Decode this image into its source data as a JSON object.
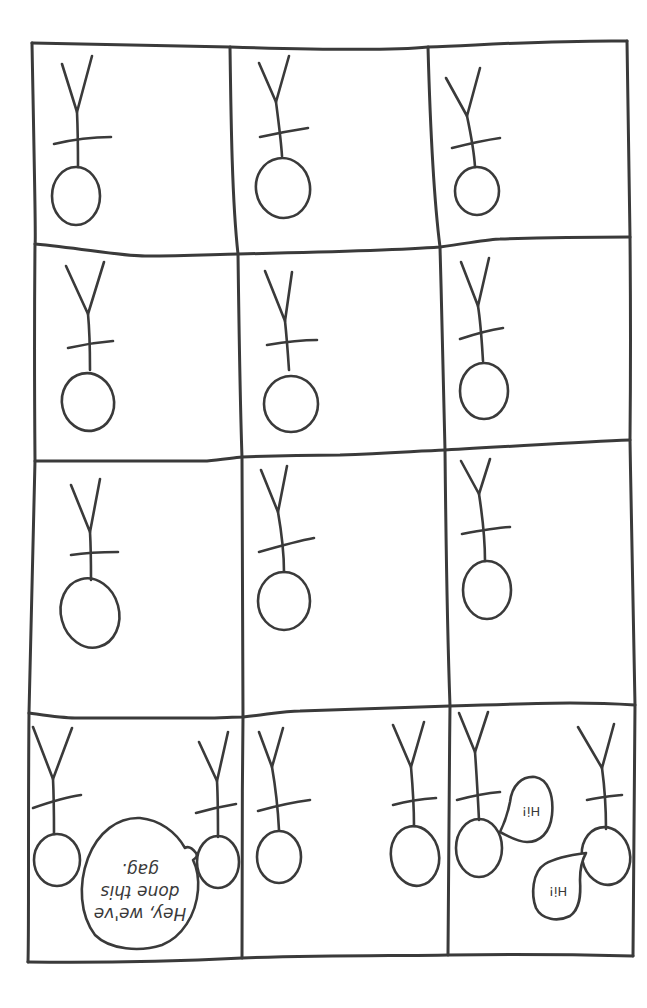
{
  "comic": {
    "layout": {
      "rows": 4,
      "columns": 3,
      "panel_count": 12
    },
    "ink_color": "#3a3a3a",
    "background_color": "#ffffff",
    "orientation_note": "all figures and text drawn upside down",
    "panels": [
      {
        "id": 1,
        "figures": 1,
        "dialogue": []
      },
      {
        "id": 2,
        "figures": 1,
        "dialogue": []
      },
      {
        "id": 3,
        "figures": 1,
        "dialogue": []
      },
      {
        "id": 4,
        "figures": 1,
        "dialogue": []
      },
      {
        "id": 5,
        "figures": 1,
        "dialogue": []
      },
      {
        "id": 6,
        "figures": 1,
        "dialogue": []
      },
      {
        "id": 7,
        "figures": 1,
        "dialogue": []
      },
      {
        "id": 8,
        "figures": 1,
        "dialogue": []
      },
      {
        "id": 9,
        "figures": 1,
        "dialogue": []
      },
      {
        "id": 10,
        "figures": 2,
        "dialogue": [
          "Hey, we've done this gag."
        ]
      },
      {
        "id": 11,
        "figures": 2,
        "dialogue": []
      },
      {
        "id": 12,
        "figures": 2,
        "dialogue": [
          "Hi!",
          "Hi!"
        ]
      }
    ],
    "speech": {
      "panel10_line1": "Hey, we've",
      "panel10_line2": "done this",
      "panel10_line3": "gag.",
      "panel12_bubble1": "Hi!",
      "panel12_bubble2": "Hi!"
    }
  }
}
